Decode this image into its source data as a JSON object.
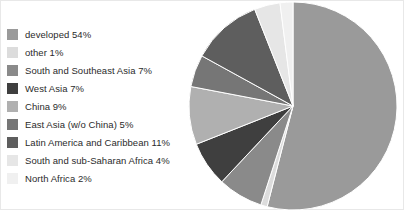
{
  "chart_data": {
    "type": "pie",
    "title": "",
    "xlabel": "",
    "ylabel": "",
    "legend_position": "left",
    "grid": false,
    "start_angle_deg": 0,
    "direction": "clockwise",
    "units": "percent",
    "categories": [
      "developed",
      "other",
      "South and Southeast Asia",
      "West Asia",
      "China",
      "East Asia (w/o China)",
      "Latin America and Caribbean",
      "South and sub-Saharan Africa",
      "North Africa"
    ],
    "values": [
      54,
      1,
      7,
      7,
      9,
      5,
      11,
      4,
      2
    ],
    "colors": [
      "#9a9a9a",
      "#dcdcdc",
      "#8a8a8a",
      "#3f3f3f",
      "#b0b0b0",
      "#767676",
      "#5e5e5e",
      "#e6e6e6",
      "#f0f0f0"
    ]
  },
  "legend": {
    "items": [
      {
        "label": "developed 54%",
        "color": "#9a9a9a",
        "icon": "color-swatch"
      },
      {
        "label": "other 1%",
        "color": "#dcdcdc",
        "icon": "color-swatch"
      },
      {
        "label": "South and Southeast Asia 7%",
        "color": "#8a8a8a",
        "icon": "color-swatch"
      },
      {
        "label": "West Asia 7%",
        "color": "#3f3f3f",
        "icon": "color-swatch"
      },
      {
        "label": "China 9%",
        "color": "#b0b0b0",
        "icon": "color-swatch"
      },
      {
        "label": "East Asia (w/o China) 5%",
        "color": "#767676",
        "icon": "color-swatch"
      },
      {
        "label": "Latin America and Caribbean 11%",
        "color": "#5e5e5e",
        "icon": "color-swatch"
      },
      {
        "label": "South and sub-Saharan Africa 4%",
        "color": "#e6e6e6",
        "icon": "color-swatch"
      },
      {
        "label": "North Africa 2%",
        "color": "#f0f0f0",
        "icon": "color-swatch"
      }
    ]
  }
}
